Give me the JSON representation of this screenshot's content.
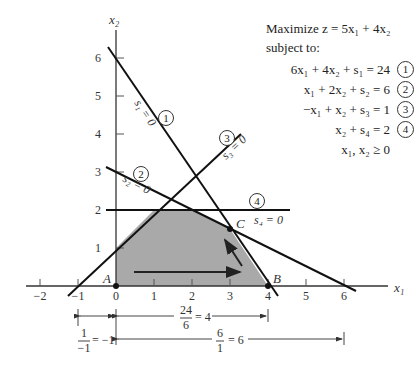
{
  "figure": {
    "objective_line1": "Maximize z = 5x₁ + 4x₂",
    "objective_line2": "subject to:",
    "constraints": [
      {
        "text": "6x₁ + 4x₂ + s₁ = 24",
        "num": "1"
      },
      {
        "text": "x₁ + 2x₂ + s₂ =  6",
        "num": "2"
      },
      {
        "text": "−x₁ + x₂ + s₃ =  1",
        "num": "3"
      },
      {
        "text": "x₂ + s₄ =  2",
        "num": "4"
      },
      {
        "text": "x₁, x₂ ≥  0",
        "num": ""
      }
    ],
    "axis_x_label": "x₁",
    "axis_y_label": "x₂",
    "x_ticks": [
      "−2",
      "−1",
      "0",
      "1",
      "2",
      "3",
      "4",
      "5",
      "6"
    ],
    "y_ticks": [
      "1",
      "2",
      "3",
      "4",
      "5",
      "6"
    ],
    "line_labels": {
      "s1": "s₁ = 0",
      "s2": "s₂ = 0",
      "s3": "s₃ = 0",
      "s4": "s₄ = 0",
      "c1": "1",
      "c2": "2",
      "c3": "3",
      "c4": "4"
    },
    "points": {
      "A": "A",
      "B": "B",
      "C": "C"
    },
    "ratios": {
      "r1_num": "1",
      "r1_den": "−1",
      "r1_val": "= −1",
      "r2_num": "24",
      "r2_den": "6",
      "r2_val": "= 4",
      "r3_num": "6",
      "r3_den": "1",
      "r3_val": "= 6"
    },
    "feasible_region_color": "#a9a9a9",
    "line_color": "#111111"
  }
}
